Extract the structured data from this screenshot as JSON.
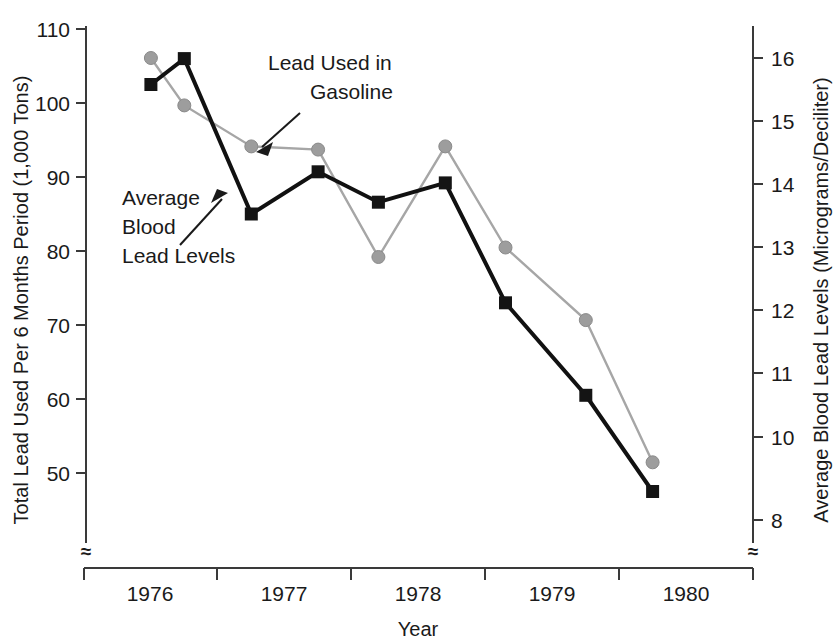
{
  "chart_data": {
    "type": "line",
    "title": "",
    "xlabel": "Year",
    "ylabel": "Total Lead  Used Per 6 Months Period (1,000 Tons)",
    "y2label": "Average Blood Lead Levels (Micrograms/Deciliter)",
    "x": [
      1976.0,
      1976.25,
      1976.75,
      1977.25,
      1977.7,
      1978.2,
      1978.65,
      1979.25,
      1979.75
    ],
    "xlim": [
      1975.5,
      1980.5
    ],
    "ylim": [
      50,
      110
    ],
    "y2lim": [
      8,
      16
    ],
    "grid": false,
    "legend_position": "in-plot annotations",
    "xticklabels": [
      "1976",
      "1977",
      "1978",
      "1979",
      "1980"
    ],
    "yticklabels": [
      "50",
      "60",
      "70",
      "80",
      "90",
      "100",
      "110"
    ],
    "y2ticklabels": [
      "8",
      "10",
      "11",
      "12",
      "13",
      "14",
      "15",
      "16"
    ],
    "yticks": [
      50,
      60,
      70,
      80,
      90,
      100,
      110
    ],
    "y2ticks": [
      8,
      10,
      11,
      12,
      13,
      14,
      15,
      16
    ],
    "axis_break_symbol": "≈",
    "series": [
      {
        "name": "Average Blood Lead Levels",
        "axis": "left",
        "color": "#141414",
        "marker": "square",
        "values": [
          102.5,
          106.0,
          85.0,
          90.7,
          86.6,
          89.2,
          73.0,
          60.5,
          47.5
        ]
      },
      {
        "name": "Lead Used in Gasoline",
        "axis": "right",
        "color": "#9d9d9d",
        "marker": "circle",
        "values": [
          16.0,
          15.25,
          14.6,
          14.55,
          12.85,
          14.6,
          13.0,
          11.85,
          9.6
        ]
      }
    ],
    "annotations": [
      {
        "text_lines": [
          "Lead Used in",
          "Gasoline"
        ],
        "target": "gray-series"
      },
      {
        "text_lines": [
          "Average",
          "Blood",
          "Lead Levels"
        ],
        "target": "black-series"
      }
    ]
  },
  "annotations": {
    "gasoline_line1": "Lead Used in",
    "gasoline_line2": "Gasoline",
    "blood_line1": "Average",
    "blood_line2": "Blood",
    "blood_line3": "Lead Levels"
  },
  "axes": {
    "left_title": "Total Lead  Used Per 6 Months Period (1,000 Tons)",
    "right_title": "Average Blood Lead Levels (Micrograms/Deciliter)",
    "x_title": "Year",
    "left_ticks": [
      "110",
      "100",
      "90",
      "80",
      "70",
      "60",
      "50"
    ],
    "right_ticks": [
      "16",
      "15",
      "14",
      "13",
      "12",
      "11",
      "10",
      "8"
    ],
    "x_ticks": [
      "1976",
      "1977",
      "1978",
      "1979",
      "1980"
    ],
    "break_symbol": "≈"
  }
}
